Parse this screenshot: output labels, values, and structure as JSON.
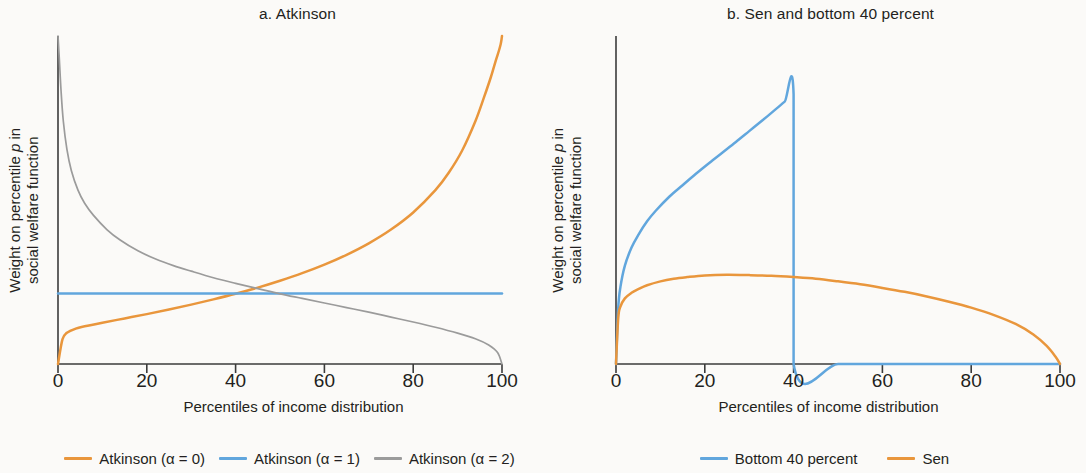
{
  "colors": {
    "background": "#fbfaf8",
    "axis": "#3b3b3b",
    "text": "#231f20",
    "orange": "#e9963c",
    "blue": "#61a6dd",
    "gray": "#9b9b9b"
  },
  "panels": [
    {
      "id": "a",
      "title": "a. Atkinson",
      "xlabel": "Percentiles of income distribution",
      "ylabel_line1": "Weight on percentile p in",
      "ylabel_line2": "social welfare function",
      "ylabel_italic": "p",
      "legend": [
        {
          "label": "Atkinson (α = 0)",
          "color": "#e9963c"
        },
        {
          "label": "Atkinson (α = 1)",
          "color": "#61a6dd"
        },
        {
          "label": "Atkinson (α = 2)",
          "color": "#9b9b9b"
        }
      ]
    },
    {
      "id": "b",
      "title": "b. Sen and bottom 40 percent",
      "xlabel": "Percentiles of income distribution",
      "ylabel_line1": "Weight on percentile p in",
      "ylabel_line2": "social welfare function",
      "ylabel_italic": "p",
      "legend": [
        {
          "label": "Bottom 40 percent",
          "color": "#61a6dd"
        },
        {
          "label": "Sen",
          "color": "#e9963c"
        }
      ]
    }
  ],
  "chart_data": [
    {
      "type": "line",
      "title": "a. Atkinson",
      "xlabel": "Percentiles of income distribution",
      "ylabel": "Weight on percentile p in social welfare function",
      "xlim": [
        0,
        100
      ],
      "ylim": [
        0,
        1
      ],
      "xticks": [
        0,
        20,
        40,
        60,
        80,
        100
      ],
      "xtick_labels": [
        "0",
        "20",
        "40",
        "60",
        "80",
        "100"
      ],
      "yticks": [],
      "grid": false,
      "legend_position": "below",
      "series": [
        {
          "name": "Atkinson (α = 0)",
          "color": "#e9963c",
          "x": [
            0,
            1,
            2,
            4,
            6,
            10,
            15,
            20,
            25,
            30,
            35,
            40,
            45,
            50,
            55,
            60,
            65,
            70,
            75,
            80,
            85,
            88,
            91,
            94,
            96,
            97.5,
            98.6,
            99.3,
            99.7,
            99.9,
            100
          ],
          "y": [
            0.0,
            0.075,
            0.095,
            0.108,
            0.115,
            0.126,
            0.139,
            0.152,
            0.166,
            0.181,
            0.197,
            0.214,
            0.233,
            0.254,
            0.277,
            0.303,
            0.333,
            0.368,
            0.41,
            0.462,
            0.53,
            0.583,
            0.65,
            0.74,
            0.815,
            0.875,
            0.925,
            0.955,
            0.975,
            0.99,
            1.0
          ]
        },
        {
          "name": "Atkinson (α = 1)",
          "color": "#61a6dd",
          "x": [
            0,
            10,
            20,
            30,
            40,
            50,
            60,
            70,
            80,
            90,
            100
          ],
          "y": [
            0.215,
            0.215,
            0.215,
            0.215,
            0.215,
            0.215,
            0.215,
            0.215,
            0.215,
            0.215,
            0.215
          ]
        },
        {
          "name": "Atkinson (α = 2)",
          "color": "#9b9b9b",
          "x": [
            0,
            0.3,
            0.7,
            1.2,
            2,
            3,
            4.5,
            6,
            8,
            11,
            14,
            18,
            22,
            26,
            30,
            35,
            40,
            45,
            50,
            55,
            60,
            65,
            70,
            75,
            80,
            85,
            90,
            94,
            97,
            99,
            100
          ],
          "y": [
            1.0,
            0.93,
            0.83,
            0.74,
            0.655,
            0.59,
            0.53,
            0.49,
            0.453,
            0.41,
            0.378,
            0.345,
            0.32,
            0.3,
            0.283,
            0.263,
            0.246,
            0.23,
            0.214,
            0.2,
            0.186,
            0.172,
            0.158,
            0.143,
            0.128,
            0.112,
            0.094,
            0.077,
            0.058,
            0.035,
            0.0
          ]
        }
      ]
    },
    {
      "type": "line",
      "title": "b. Sen and bottom 40 percent",
      "xlabel": "Percentiles of income distribution",
      "ylabel": "Weight on percentile p in social welfare function",
      "xlim": [
        0,
        100
      ],
      "ylim": [
        0,
        1
      ],
      "xticks": [
        0,
        20,
        40,
        60,
        80,
        100
      ],
      "xtick_labels": [
        "0",
        "20",
        "40",
        "60",
        "80",
        "100"
      ],
      "yticks": [],
      "grid": false,
      "legend_position": "below",
      "series": [
        {
          "name": "Bottom 40 percent",
          "color": "#61a6dd",
          "x": [
            0,
            0.5,
            1,
            2,
            3.5,
            5,
            7,
            9,
            12,
            15,
            18,
            21,
            24,
            27,
            30,
            33,
            36,
            38,
            40,
            40,
            50,
            60,
            70,
            80,
            90,
            100
          ],
          "y": [
            0.0,
            0.17,
            0.235,
            0.3,
            0.355,
            0.393,
            0.435,
            0.468,
            0.51,
            0.545,
            0.58,
            0.613,
            0.645,
            0.677,
            0.71,
            0.743,
            0.777,
            0.8,
            0.822,
            0.0,
            0.0,
            0.0,
            0.0,
            0.0,
            0.0,
            0.0
          ]
        },
        {
          "name": "Sen",
          "color": "#e9963c",
          "x": [
            0,
            0.5,
            1,
            2,
            3.5,
            5,
            7,
            10,
            13,
            16,
            20,
            25,
            30,
            35,
            40,
            45,
            50,
            55,
            60,
            65,
            70,
            75,
            80,
            85,
            90,
            94,
            97,
            99,
            100
          ],
          "y": [
            0.0,
            0.14,
            0.175,
            0.2,
            0.217,
            0.228,
            0.24,
            0.252,
            0.26,
            0.265,
            0.27,
            0.272,
            0.271,
            0.269,
            0.265,
            0.26,
            0.252,
            0.243,
            0.232,
            0.22,
            0.206,
            0.19,
            0.172,
            0.15,
            0.122,
            0.09,
            0.055,
            0.022,
            0.0
          ]
        }
      ]
    }
  ],
  "geometry": {
    "plot_left": 58,
    "plot_right": 502,
    "plot_top": 36,
    "plot_bottom": 364,
    "tick_length": 9,
    "tick_label_y": 370
  }
}
